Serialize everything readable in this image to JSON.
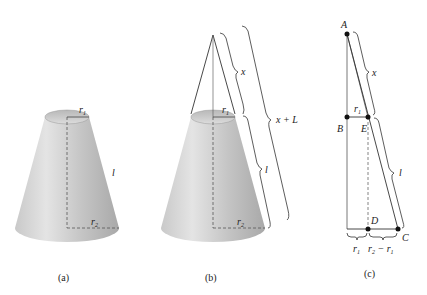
{
  "figure": {
    "panels": [
      {
        "id": "a",
        "caption": "(a)",
        "labels": {
          "top_radius": "r",
          "top_radius_sub": "1",
          "bottom_radius": "r",
          "bottom_radius_sub": "2",
          "slant": "l"
        }
      },
      {
        "id": "b",
        "caption": "(b)",
        "labels": {
          "top_radius": "r",
          "top_radius_sub": "1",
          "bottom_radius": "r",
          "bottom_radius_sub": "2",
          "upper_slant": "x",
          "lower_slant": "l",
          "full_slant": "x + L"
        }
      },
      {
        "id": "c",
        "caption": "(c)",
        "points": {
          "A": "A",
          "B": "B",
          "C": "C",
          "D": "D",
          "E": "E"
        },
        "labels": {
          "top_segment": "r",
          "top_segment_sub": "1",
          "upper_slant": "x",
          "lower_slant": "l",
          "bottom_left": "r",
          "bottom_left_sub": "1",
          "bottom_right_a": "r",
          "bottom_right_a_sub": "2",
          "bottom_right_minus": " − ",
          "bottom_right_b": "r",
          "bottom_right_b_sub": "1"
        }
      }
    ]
  }
}
